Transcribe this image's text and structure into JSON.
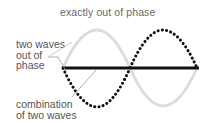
{
  "diagram": {
    "title": "exactly out of phase",
    "labels": {
      "two_waves": [
        "two waves",
        "out of",
        "phase"
      ],
      "combination": [
        "combination",
        "of two waves"
      ]
    },
    "colors": {
      "wave_a": "#dcdcdc",
      "wave_b": "#111111",
      "combined": "#111111",
      "leader": "#9a9a9a",
      "text": "#555555"
    },
    "waves": [
      {
        "name": "wave A",
        "style": "solid light gray",
        "phase": "up first"
      },
      {
        "name": "wave B",
        "style": "dotted black",
        "phase": "down first (180° out of phase)"
      },
      {
        "name": "combination",
        "style": "solid thick black",
        "description": "flat line (cancellation)"
      }
    ]
  }
}
